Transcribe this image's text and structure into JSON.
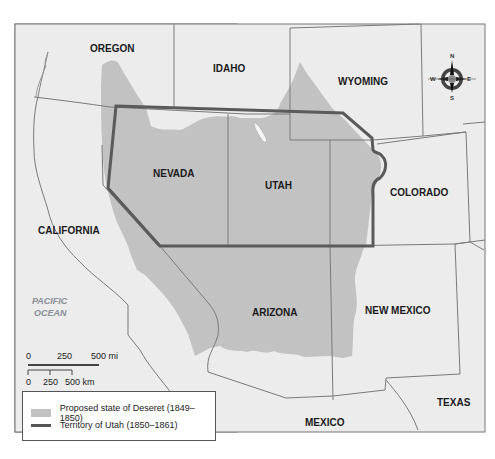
{
  "map": {
    "states": [
      {
        "name": "OREGON",
        "x": 90,
        "y": 52
      },
      {
        "name": "IDAHO",
        "x": 213,
        "y": 72
      },
      {
        "name": "WYOMING",
        "x": 338,
        "y": 85
      },
      {
        "name": "NEVADA",
        "x": 153,
        "y": 177
      },
      {
        "name": "UTAH",
        "x": 265,
        "y": 189
      },
      {
        "name": "COLORADO",
        "x": 390,
        "y": 196
      },
      {
        "name": "CALIFORNIA",
        "x": 38,
        "y": 234
      },
      {
        "name": "ARIZONA",
        "x": 252,
        "y": 316
      },
      {
        "name": "NEW MEXICO",
        "x": 365,
        "y": 314
      },
      {
        "name": "TEXAS",
        "x": 437,
        "y": 406
      },
      {
        "name": "MEXICO",
        "x": 305,
        "y": 426
      }
    ],
    "ocean_label": [
      "PACIFIC",
      "OCEAN"
    ],
    "compass": {
      "n": "N",
      "s": "S",
      "e": "E",
      "w": "W"
    },
    "scale_miles": {
      "ticks": [
        "0",
        "250",
        "500 mi"
      ]
    },
    "scale_km": {
      "ticks": [
        "0",
        "250",
        "500 km"
      ]
    },
    "colors": {
      "background": "#ececec",
      "deseret_fill": "#c2c2c2",
      "territory_line": "#5a5a5a",
      "border": "#7a7a7a"
    }
  },
  "legend": {
    "items": [
      {
        "label": "Proposed state of Deseret (1849–1850)",
        "type": "fill"
      },
      {
        "label": "Territory of Utah (1850–1861)",
        "type": "line"
      }
    ]
  }
}
